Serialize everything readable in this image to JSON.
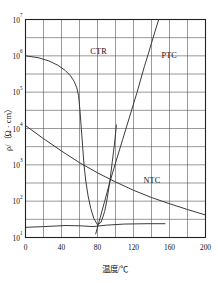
{
  "chart_data": {
    "type": "line",
    "title": "",
    "xlabel": "温度/℃",
    "ylabel": "ρ/（Ω · cm）",
    "xlim": [
      0,
      200
    ],
    "ylim_log10": [
      1,
      7
    ],
    "yscale": "log",
    "grid": true,
    "legend": "inline-annotations",
    "xticks": [
      "0",
      "40",
      "80",
      "120",
      "160",
      "200"
    ],
    "xtick_values": [
      0,
      40,
      80,
      120,
      160,
      200
    ],
    "x_minor_step": 20,
    "yticks": [
      "10¹",
      "10²",
      "10³",
      "10⁴",
      "10⁵",
      "10⁶",
      "10⁷"
    ],
    "ytick_bases": [
      "10",
      "10",
      "10",
      "10",
      "10",
      "10",
      "10"
    ],
    "ytick_exponents": [
      "1",
      "2",
      "3",
      "4",
      "5",
      "6",
      "7"
    ],
    "ytick_values": [
      10,
      100,
      1000,
      10000,
      100000,
      1000000,
      10000000
    ],
    "y_minor": "half-decade gridlines between each decade",
    "series": [
      {
        "name": "CTR",
        "label": "CTR",
        "label_position": {
          "x": 72,
          "y": 6.05
        },
        "description": "Critical temperature resistor: flat near 1e6 then abrupt drop around 60-70°C to a minimum near 80°C, then rising",
        "points": [
          {
            "x": 0,
            "y_log10": 6.0
          },
          {
            "x": 14,
            "y_log10": 5.95
          },
          {
            "x": 26,
            "y_log10": 5.86
          },
          {
            "x": 36,
            "y_log10": 5.74
          },
          {
            "x": 44,
            "y_log10": 5.6
          },
          {
            "x": 50,
            "y_log10": 5.45
          },
          {
            "x": 54,
            "y_log10": 5.3
          },
          {
            "x": 57,
            "y_log10": 5.12
          },
          {
            "x": 59,
            "y_log10": 4.9
          },
          {
            "x": 60.5,
            "y_log10": 4.5
          },
          {
            "x": 62,
            "y_log10": 4.0
          },
          {
            "x": 63.5,
            "y_log10": 3.5
          },
          {
            "x": 65,
            "y_log10": 3.0
          },
          {
            "x": 67,
            "y_log10": 2.55
          },
          {
            "x": 69.5,
            "y_log10": 2.15
          },
          {
            "x": 72.5,
            "y_log10": 1.8
          },
          {
            "x": 76,
            "y_log10": 1.52
          },
          {
            "x": 80,
            "y_log10": 1.35
          },
          {
            "x": 84,
            "y_log10": 1.42
          },
          {
            "x": 88,
            "y_log10": 1.72
          },
          {
            "x": 91,
            "y_log10": 2.1
          },
          {
            "x": 94,
            "y_log10": 2.6
          },
          {
            "x": 96.5,
            "y_log10": 3.1
          },
          {
            "x": 99,
            "y_log10": 3.6
          },
          {
            "x": 101,
            "y_log10": 4.1
          }
        ]
      },
      {
        "name": "PTC",
        "label": "PTC",
        "label_position": {
          "x": 151,
          "y": 5.95
        },
        "description": "Positive temperature coefficient: flat baseline near 1e1.35 from 0°C to ~155°C, plus a steeply rising branch from ~78°C to top of axis at ~137°C",
        "baseline_points": [
          {
            "x": 0,
            "y_log10": 1.28
          },
          {
            "x": 20,
            "y_log10": 1.3
          },
          {
            "x": 45,
            "y_log10": 1.33
          },
          {
            "x": 62,
            "y_log10": 1.32
          },
          {
            "x": 75,
            "y_log10": 1.3
          },
          {
            "x": 90,
            "y_log10": 1.34
          },
          {
            "x": 110,
            "y_log10": 1.37
          },
          {
            "x": 135,
            "y_log10": 1.38
          },
          {
            "x": 155,
            "y_log10": 1.38
          }
        ],
        "rising_points": [
          {
            "x": 78,
            "y_log10": 1.1
          },
          {
            "x": 83,
            "y_log10": 1.55
          },
          {
            "x": 88,
            "y_log10": 2.0
          },
          {
            "x": 94,
            "y_log10": 2.55
          },
          {
            "x": 100,
            "y_log10": 3.05
          },
          {
            "x": 108,
            "y_log10": 3.7
          },
          {
            "x": 116,
            "y_log10": 4.35
          },
          {
            "x": 124,
            "y_log10": 5.0
          },
          {
            "x": 132,
            "y_log10": 5.7
          },
          {
            "x": 137,
            "y_log10": 6.1
          },
          {
            "x": 143,
            "y_log10": 6.6
          },
          {
            "x": 148,
            "y_log10": 7.0
          }
        ]
      },
      {
        "name": "NTC",
        "label": "NTC",
        "label_position": {
          "x": 131,
          "y": 2.5
        },
        "description": "Negative temperature coefficient: smooth monotonic decrease from ~1e4 at 0°C to ~1e1.6 at 200°C",
        "points": [
          {
            "x": 0,
            "y_log10": 4.08
          },
          {
            "x": 20,
            "y_log10": 3.72
          },
          {
            "x": 40,
            "y_log10": 3.38
          },
          {
            "x": 60,
            "y_log10": 3.06
          },
          {
            "x": 80,
            "y_log10": 2.78
          },
          {
            "x": 100,
            "y_log10": 2.53
          },
          {
            "x": 120,
            "y_log10": 2.3
          },
          {
            "x": 140,
            "y_log10": 2.1
          },
          {
            "x": 160,
            "y_log10": 1.93
          },
          {
            "x": 180,
            "y_log10": 1.77
          },
          {
            "x": 200,
            "y_log10": 1.62
          }
        ]
      }
    ]
  },
  "colors": {
    "curve": "#303030",
    "grid": "#555555",
    "frame": "#222222",
    "text": "#111111",
    "background": "#ffffff"
  }
}
